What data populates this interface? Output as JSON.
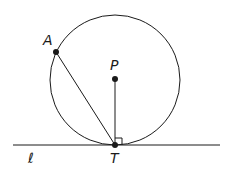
{
  "diagram": {
    "labels": {
      "A": "A",
      "P": "P",
      "T": "T",
      "line": "ℓ"
    },
    "points": {
      "A": {
        "x": 56,
        "y": 52
      },
      "P": {
        "x": 115,
        "y": 79
      },
      "T": {
        "x": 115,
        "y": 145
      }
    },
    "circle": {
      "cx": 115,
      "cy": 80,
      "r": 65
    },
    "line_l": {
      "x1": 13,
      "y1": 145,
      "x2": 220,
      "y2": 145
    },
    "colors": {
      "stroke": "#1a1a1a",
      "background": "#ffffff"
    }
  }
}
